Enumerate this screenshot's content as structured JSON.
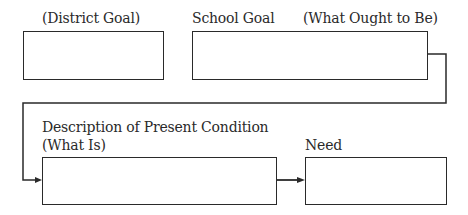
{
  "diagram": {
    "labels": {
      "district_goal": "(District Goal)",
      "school_goal": "School Goal",
      "what_ought_to_be": "(What Ought to Be)",
      "present_condition": "Description of Present Condition",
      "what_is": "(What Is)",
      "need": "Need"
    },
    "boxes": [
      {
        "id": "district-goal-box",
        "content": ""
      },
      {
        "id": "school-goal-box",
        "content": ""
      },
      {
        "id": "present-condition-box",
        "content": ""
      },
      {
        "id": "need-box",
        "content": ""
      }
    ],
    "colors": {
      "line": "#2a2a2a",
      "background": "#ffffff"
    }
  }
}
